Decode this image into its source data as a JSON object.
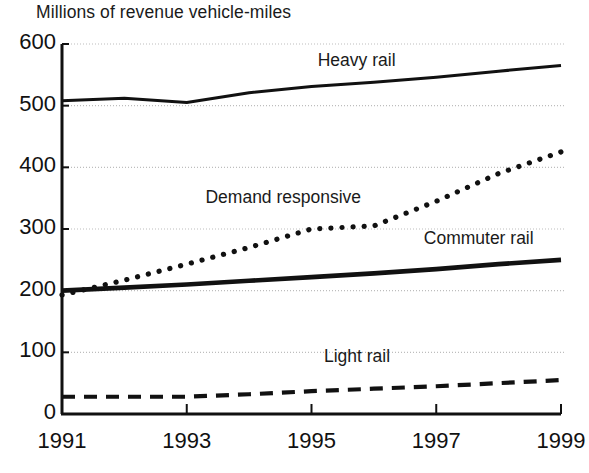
{
  "chart_data": {
    "type": "line",
    "title": "Millions of revenue vehicle-miles",
    "xlabel": "",
    "ylabel": "",
    "x": [
      1991,
      1992,
      1993,
      1994,
      1995,
      1996,
      1997,
      1998,
      1999
    ],
    "xlim": [
      1991,
      1999
    ],
    "ylim": [
      0,
      600
    ],
    "xticks": [
      1991,
      1993,
      1995,
      1997,
      1999
    ],
    "xtick_labels": [
      "1991",
      "1993",
      "1995",
      "1997",
      "1999"
    ],
    "yticks": [
      0,
      100,
      200,
      300,
      400,
      500,
      600
    ],
    "ytick_labels": [
      "0",
      "100",
      "200",
      "300",
      "400",
      "500",
      "600"
    ],
    "grid": true,
    "grid_style": "dotted-horizontal",
    "legend": "inline-annotations",
    "series": [
      {
        "name": "Heavy rail",
        "style": "solid",
        "values": [
          508,
          512,
          505,
          521,
          531,
          538,
          546,
          556,
          565
        ],
        "label_x": 1995.1,
        "label_y": 572
      },
      {
        "name": "Demand responsive",
        "style": "dotted",
        "values": [
          193,
          217,
          243,
          270,
          300,
          305,
          345,
          390,
          425
        ],
        "label_x": 1993.3,
        "label_y": 350
      },
      {
        "name": "Commuter rail",
        "style": "solid-thick",
        "values": [
          200,
          205,
          210,
          216,
          222,
          228,
          235,
          243,
          250
        ],
        "label_x": 1996.8,
        "label_y": 283
      },
      {
        "name": "Light rail",
        "style": "dashed",
        "values": [
          28,
          28,
          28,
          32,
          37,
          41,
          45,
          50,
          55
        ],
        "label_x": 1995.2,
        "label_y": 92
      }
    ]
  },
  "colors": {
    "ink": "#111111",
    "grid": "#bdbdbd",
    "background": "#ffffff"
  }
}
